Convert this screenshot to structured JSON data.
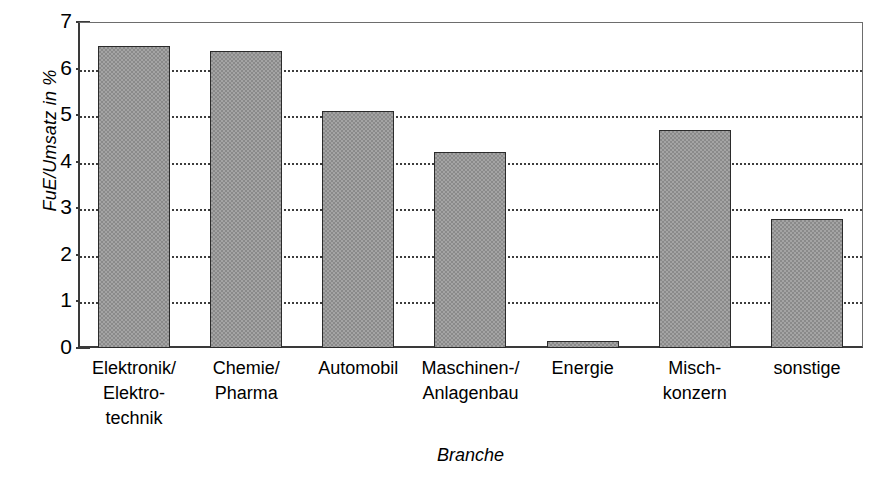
{
  "chart_data": {
    "type": "bar",
    "title": "",
    "xlabel": "Branche",
    "ylabel": "FuE/Umsatz in %",
    "ylim": [
      0,
      7
    ],
    "yticks": [
      0,
      1,
      2,
      3,
      4,
      5,
      6,
      7
    ],
    "ytick_labels": [
      "0",
      "1",
      "2",
      "3",
      "4",
      "5",
      "6",
      "7"
    ],
    "grid": "horizontal-dotted",
    "legend": "none",
    "bar_color": "#8a8a8a",
    "bar_edge_color": "#2b2b2b",
    "axis_color": "#3a3a3a",
    "categories": [
      "Elektronik/\nElektro-\ntechnik",
      "Chemie/\nPharma",
      "Automobil",
      "Maschinen-/\nAnlagenbau",
      "Energie",
      "Misch-\nkonzern",
      "sonstige"
    ],
    "category_labels_flat": [
      "Elektronik/ Elektrotechnik",
      "Chemie/ Pharma",
      "Automobil",
      "Maschinen-/ Anlagenbau",
      "Energie",
      "Mischkonzern",
      "sonstige"
    ],
    "values": [
      6.48,
      6.37,
      5.08,
      4.21,
      0.15,
      4.69,
      2.78
    ]
  }
}
